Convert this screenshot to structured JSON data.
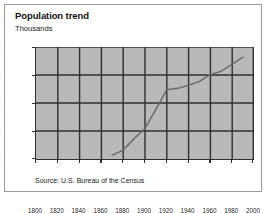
{
  "figure": {
    "title": "Population trend",
    "subtitle": "Thousands",
    "source": "Source: U.S. Bureau of the Census"
  },
  "chart_data": {
    "type": "line",
    "title": "Population trend",
    "subtitle": "Thousands",
    "xlabel": "",
    "ylabel": "Thousands",
    "xlim": [
      1800,
      2000
    ],
    "ylim": [
      0,
      880
    ],
    "xticks": [
      1800,
      1820,
      1840,
      1860,
      1880,
      1900,
      1920,
      1940,
      1960,
      1980,
      2000
    ],
    "yticks": [
      0,
      220,
      440,
      660,
      880
    ],
    "grid": true,
    "legend": "none",
    "line_color": "#6b6b6b",
    "plot_background": "#b9b9b9",
    "axis_color": "#2f2f2f",
    "source": "Source: U.S. Bureau of the Census",
    "series": [
      {
        "name": "Population",
        "x": [
          1870,
          1880,
          1890,
          1900,
          1910,
          1920,
          1925,
          1930,
          1940,
          1950,
          1960,
          1970,
          1980,
          1990
        ],
        "values": [
          30,
          70,
          160,
          240,
          390,
          545,
          550,
          555,
          580,
          610,
          665,
          690,
          745,
          800
        ]
      }
    ]
  }
}
